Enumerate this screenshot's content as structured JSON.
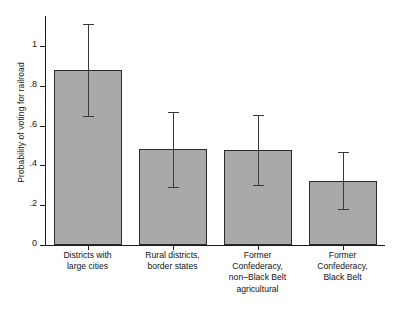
{
  "chart_data": {
    "type": "bar",
    "title": "",
    "xlabel": "",
    "ylabel": "Probability of voting for railroad",
    "ylim": [
      0,
      1.15
    ],
    "yticks": [
      "0",
      ".2",
      ".4",
      ".6",
      ".8",
      "1"
    ],
    "ytick_values": [
      0,
      0.2,
      0.4,
      0.6,
      0.8,
      1
    ],
    "grid": false,
    "legend": "none",
    "categories": [
      "Districts with\nlarge cities",
      "Rural districts,\nborder states",
      "Former\nConfederacy,\nnon–Black Belt\nagricultural",
      "Former\nConfederacy,\nBlack Belt"
    ],
    "values": [
      0.88,
      0.48,
      0.475,
      0.32
    ],
    "error_low": [
      0.65,
      0.29,
      0.3,
      0.18
    ],
    "error_high": [
      1.11,
      0.67,
      0.655,
      0.465
    ],
    "bar_fill_color": "#a9a9a9",
    "bar_edge_color": "#2a2a2a",
    "error_color": "#3a3a3a",
    "axis_color": "#1b1b1b"
  }
}
